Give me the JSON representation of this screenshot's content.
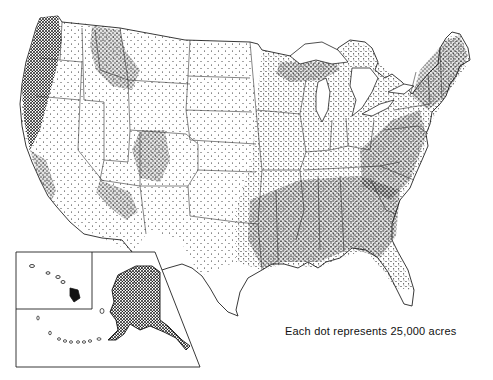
{
  "map": {
    "type": "dot-density",
    "region": "United States (conterminous, Alaska and Hawaii insets)",
    "legend_text": "Each dot represents 25,000 acres",
    "dot_value_acres": 25000,
    "colors": {
      "ink": "#111111",
      "background": "#ffffff"
    },
    "insets": [
      "Hawaii",
      "Alaska"
    ]
  }
}
